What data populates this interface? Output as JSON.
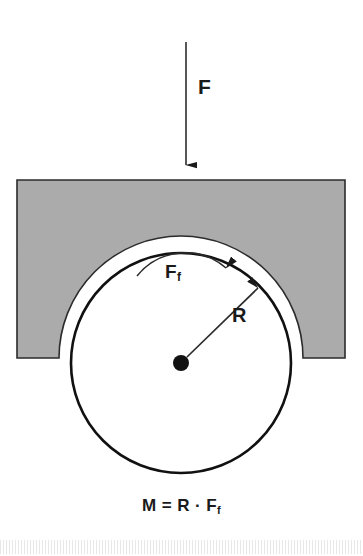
{
  "figure": {
    "title_visible": false,
    "background_color": "#ffffff",
    "block_fill_color": "#ababab",
    "outline_color": "#1a1a1a",
    "labels": {
      "applied_force": "F",
      "friction_force_base": "F",
      "friction_force_sub": "f",
      "radius": "R"
    },
    "equation": {
      "moment_symbol": "M",
      "equals": "=",
      "radius_symbol": "R",
      "dot_operator": "·",
      "friction_base": "F",
      "friction_sub": "f",
      "full_text": "M = R · F f"
    },
    "geometry": {
      "block_left": 17,
      "block_right": 345,
      "block_top": 180,
      "block_bottom": 358,
      "cutout_radius": 122,
      "circle_center_x": 181,
      "circle_center_y": 363,
      "circle_radius": 110,
      "hub_dot_radius": 8,
      "force_arrow_x": 186,
      "force_arrow_top_y": 42,
      "force_arrow_tip_y": 176,
      "radius_arrow_angle_deg": 45,
      "friction_arc_direction": "clockwise"
    }
  }
}
